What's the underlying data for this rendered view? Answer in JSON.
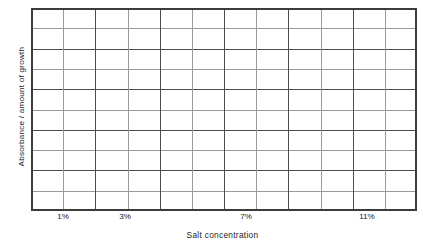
{
  "chart_data": {
    "type": "table",
    "title": "",
    "subtitle": "",
    "xlabel": "Salt concentration",
    "ylabel": "Absorbance / amount of growth",
    "grid": true,
    "legend": null,
    "series": [],
    "values": [],
    "categories": [],
    "x_tick_labels": [
      "1%",
      "3%",
      "7%",
      "11%"
    ],
    "x_tick_positions": [
      2,
      4,
      8,
      12
    ],
    "y_tick_labels": [],
    "xlim": [
      0,
      14
    ],
    "ylim": [
      0,
      10
    ],
    "grid_columns": 12,
    "grid_rows": 10,
    "major_every_columns": 2,
    "major_every_rows": 2,
    "colors": {
      "major_gridline": "#4d4d4d",
      "minor_gridline": "#9a9a9a",
      "border": "#3c3c3c",
      "background": "#ffffff",
      "text": "#1a1a1a"
    }
  },
  "axes": {
    "y_label": "Absorbance / amount of growth",
    "x_label": "Salt concentration",
    "x_ticks": [
      {
        "label": "1%",
        "x_px": 63
      },
      {
        "label": "3%",
        "x_px": 125
      },
      {
        "label": "7%",
        "x_px": 246
      },
      {
        "label": "11%",
        "x_px": 367
      }
    ]
  }
}
